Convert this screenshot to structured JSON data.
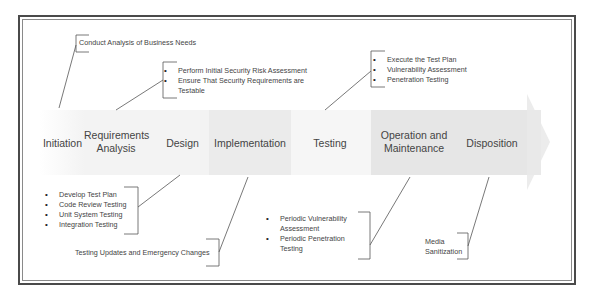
{
  "diagram": {
    "stages": [
      {
        "id": "initiation",
        "label": "Initiation"
      },
      {
        "id": "requirements",
        "label": "Requirements Analysis",
        "line1": "Requirements",
        "line2": "Analysis"
      },
      {
        "id": "design",
        "label": "Design"
      },
      {
        "id": "implementation",
        "label": "Implementation"
      },
      {
        "id": "testing",
        "label": "Testing"
      },
      {
        "id": "operation",
        "label": "Operation and Maintenance",
        "line1": "Operation and",
        "line2": "Maintenance"
      },
      {
        "id": "disposition",
        "label": "Disposition"
      }
    ],
    "notes": {
      "initiation": {
        "text": "Conduct Analysis of Business Needs"
      },
      "requirements": {
        "items": [
          "Perform Initial Security Risk Assessment",
          "Ensure That Security Requirements are Testable"
        ]
      },
      "design": {
        "items": [
          "Develop Test Plan",
          "Code Review Testing",
          "Unit System Testing",
          "Integration Testing"
        ]
      },
      "implementation": {
        "text": "Testing Updates and Emergency Changes"
      },
      "testing": {
        "items": [
          "Execute the Test Plan",
          "Vulnerability Assessment",
          "Penetration Testing"
        ]
      },
      "operation": {
        "items": [
          "Periodic Vulnerability Assessment",
          "Periodic Penetration Testing"
        ]
      },
      "disposition": {
        "line1": "Media",
        "line2": "Sanitization"
      }
    },
    "colors": {
      "frame": "#4a4a4a",
      "band_light": "#f4f4f4",
      "band_mid": "#ececec",
      "band_dark": "#e4e4e4",
      "connector": "#555555"
    }
  }
}
